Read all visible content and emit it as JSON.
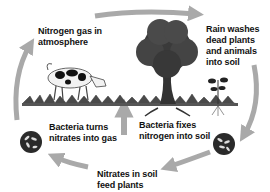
{
  "diagram": {
    "colors": {
      "arrow": "#a9a9a9",
      "text": "#111111",
      "background": "#ffffff",
      "tree_foliage": "#3a3a3a",
      "bacteria_circle": "#2a2a2a"
    },
    "nodes": [
      {
        "id": "atmosphere",
        "label": "Nitrogen gas in\natmosphere"
      },
      {
        "id": "rain",
        "label": "Rain washes\ndead plants\nand animals\ninto soil"
      },
      {
        "id": "fix",
        "label": "Bacteria fixes\nnitrogen into soil"
      },
      {
        "id": "nitrates",
        "label": "Nitrates in soil\nfeed plants"
      },
      {
        "id": "denitrify",
        "label": "Bacteria turns\nnitrates into gas"
      }
    ],
    "edges": [
      {
        "from": "atmosphere",
        "to": "rain",
        "direction": "clockwise-top"
      },
      {
        "from": "rain",
        "to": "fix",
        "direction": "clockwise-right"
      },
      {
        "from": "fix",
        "to": "nitrates",
        "direction": "clockwise-bottom"
      },
      {
        "from": "nitrates",
        "to": "denitrify",
        "direction": "clockwise-bottom-left"
      },
      {
        "from": "denitrify",
        "to": "atmosphere",
        "direction": "clockwise-left"
      },
      {
        "from": "nitrates",
        "to": "plants",
        "direction": "up"
      }
    ],
    "illustrations": [
      "cow",
      "tree",
      "grass",
      "small-plant",
      "bacteria-circle-right",
      "bacteria-circle-left"
    ]
  }
}
